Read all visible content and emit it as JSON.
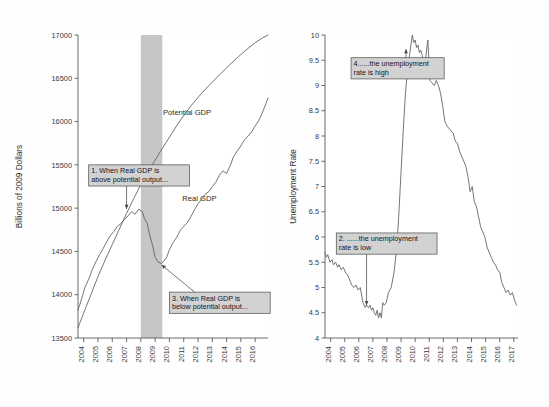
{
  "figure": {
    "background": "#fefefe",
    "line_color": "#5d5d5d",
    "recession_color": "#c6c6c6",
    "callout_fill": "#d2d2d2"
  },
  "chart_data": [
    {
      "type": "line",
      "panel": "left",
      "title": "",
      "xlabel": "",
      "ylabel": "Billions of 2009 Dollars",
      "xlim": [
        2003.6,
        2016.9
      ],
      "ylim": [
        13500,
        17000
      ],
      "yticks": [
        13500,
        14000,
        14500,
        15000,
        15500,
        16000,
        16500,
        17000
      ],
      "xticks": [
        2004,
        2005,
        2006,
        2007,
        2008,
        2009,
        2010,
        2011,
        2012,
        2013,
        2014,
        2015,
        2016
      ],
      "grid": false,
      "legend_position": "inline-labels",
      "shaded_regions": [
        {
          "name": "recession",
          "x0": 2008.0,
          "x1": 2009.5
        }
      ],
      "series": [
        {
          "name": "Potential GDP",
          "label_x": 2009.55,
          "label_y": 16080,
          "x": [
            2003.6,
            2004.0,
            2004.5,
            2005.0,
            2005.5,
            2006.0,
            2006.5,
            2007.0,
            2007.5,
            2008.0,
            2008.5,
            2009.0,
            2009.5,
            2010.0,
            2010.5,
            2011.0,
            2011.5,
            2012.0,
            2012.5,
            2013.0,
            2013.5,
            2014.0,
            2014.5,
            2015.0,
            2015.5,
            2016.0,
            2016.5,
            2016.9
          ],
          "values": [
            13620,
            13790,
            14000,
            14210,
            14400,
            14580,
            14760,
            14940,
            15110,
            15275,
            15420,
            15555,
            15690,
            15820,
            15950,
            16070,
            16180,
            16280,
            16370,
            16455,
            16540,
            16620,
            16700,
            16775,
            16845,
            16910,
            16965,
            17000
          ]
        },
        {
          "name": "Real GDP",
          "label_x": 2010.9,
          "label_y": 15080,
          "x": [
            2003.6,
            2003.85,
            2004.1,
            2004.35,
            2004.6,
            2004.85,
            2005.1,
            2005.35,
            2005.6,
            2005.85,
            2006.1,
            2006.35,
            2006.6,
            2006.85,
            2007.1,
            2007.35,
            2007.6,
            2007.85,
            2008.1,
            2008.25,
            2008.45,
            2008.6,
            2008.85,
            2009.0,
            2009.2,
            2009.4,
            2009.6,
            2009.8,
            2010.0,
            2010.25,
            2010.5,
            2010.75,
            2011.0,
            2011.25,
            2011.5,
            2011.75,
            2012.0,
            2012.25,
            2012.5,
            2012.75,
            2013.0,
            2013.25,
            2013.5,
            2013.75,
            2014.0,
            2014.25,
            2014.5,
            2014.75,
            2015.0,
            2015.25,
            2015.5,
            2015.75,
            2016.0,
            2016.25,
            2016.5,
            2016.9
          ],
          "values": [
            13820,
            13950,
            14090,
            14180,
            14290,
            14380,
            14460,
            14530,
            14610,
            14680,
            14730,
            14790,
            14820,
            14870,
            14910,
            14960,
            14930,
            14990,
            14960,
            14880,
            14820,
            14700,
            14550,
            14430,
            14380,
            14360,
            14385,
            14430,
            14520,
            14600,
            14660,
            14740,
            14790,
            14830,
            14900,
            14980,
            15050,
            15100,
            15160,
            15190,
            15250,
            15300,
            15380,
            15430,
            15400,
            15490,
            15600,
            15660,
            15720,
            15790,
            15830,
            15880,
            15950,
            16010,
            16100,
            16270
          ]
        }
      ],
      "annotations": [
        {
          "id": "callout-1",
          "text_lines": [
            "1. When Real GDP is",
            "above potential output..."
          ],
          "box_x": 2004.35,
          "box_y": 15500,
          "point_x": 2007.0,
          "point_y": 14990
        },
        {
          "id": "callout-3",
          "text_lines": [
            "3. When Real GDP is",
            "below potential output..."
          ],
          "box_x": 2010.0,
          "box_y": 14030,
          "point_x": 2009.45,
          "point_y": 14345
        }
      ]
    },
    {
      "type": "line",
      "panel": "right",
      "title": "",
      "xlabel": "",
      "ylabel": "Unemployment Rate",
      "xlim": [
        2003.6,
        2017.3
      ],
      "ylim": [
        4,
        10
      ],
      "yticks": [
        4,
        4.5,
        5,
        5.5,
        6,
        6.5,
        7,
        7.5,
        8,
        8.5,
        9,
        9.5,
        10
      ],
      "xticks": [
        2004,
        2005,
        2006,
        2007,
        2008,
        2009,
        2010,
        2011,
        2012,
        2013,
        2014,
        2015,
        2016,
        2017
      ],
      "grid": false,
      "legend_position": "none",
      "series": [
        {
          "name": "Unemployment Rate",
          "x": [
            2003.6,
            2003.7,
            2003.8,
            2003.95,
            2004.1,
            2004.2,
            2004.35,
            2004.5,
            2004.6,
            2004.75,
            2004.9,
            2005.05,
            2005.2,
            2005.35,
            2005.5,
            2005.65,
            2005.8,
            2005.95,
            2006.1,
            2006.2,
            2006.3,
            2006.45,
            2006.55,
            2006.7,
            2006.8,
            2006.9,
            2007.0,
            2007.1,
            2007.2,
            2007.3,
            2007.4,
            2007.5,
            2007.6,
            2007.7,
            2007.8,
            2007.95,
            2008.1,
            2008.3,
            2008.5,
            2008.7,
            2008.85,
            2009.0,
            2009.15,
            2009.3,
            2009.45,
            2009.6,
            2009.7,
            2009.8,
            2009.9,
            2010.0,
            2010.1,
            2010.2,
            2010.3,
            2010.4,
            2010.5,
            2010.6,
            2010.75,
            2010.9,
            2011.05,
            2011.2,
            2011.35,
            2011.5,
            2011.65,
            2011.8,
            2011.95,
            2012.1,
            2012.25,
            2012.4,
            2012.55,
            2012.7,
            2012.85,
            2013.0,
            2013.15,
            2013.3,
            2013.45,
            2013.6,
            2013.75,
            2013.9,
            2014.05,
            2014.2,
            2014.35,
            2014.5,
            2014.65,
            2014.8,
            2014.95,
            2015.1,
            2015.25,
            2015.4,
            2015.55,
            2015.7,
            2015.85,
            2016.0,
            2016.15,
            2016.3,
            2016.45,
            2016.6,
            2016.75,
            2016.9,
            2017.05,
            2017.2
          ],
          "values": [
            5.7,
            5.6,
            5.65,
            5.5,
            5.55,
            5.45,
            5.5,
            5.4,
            5.45,
            5.35,
            5.4,
            5.3,
            5.25,
            5.15,
            5.05,
            5.0,
            5.05,
            4.95,
            5.0,
            4.85,
            4.7,
            4.6,
            4.65,
            4.6,
            4.65,
            4.55,
            4.6,
            4.5,
            4.45,
            4.55,
            4.4,
            4.5,
            4.4,
            4.7,
            4.65,
            4.7,
            4.9,
            5.0,
            5.3,
            5.8,
            6.5,
            7.3,
            8.1,
            8.8,
            9.3,
            9.6,
            9.8,
            10.0,
            9.85,
            9.9,
            9.75,
            9.8,
            9.65,
            9.7,
            9.6,
            9.45,
            9.55,
            9.9,
            9.1,
            9.05,
            9.0,
            9.1,
            9.0,
            8.85,
            8.6,
            8.3,
            8.2,
            8.15,
            8.1,
            8.05,
            7.9,
            7.85,
            7.7,
            7.6,
            7.5,
            7.4,
            7.2,
            6.9,
            7.0,
            6.7,
            6.6,
            6.4,
            6.2,
            6.1,
            6.0,
            5.8,
            5.7,
            5.6,
            5.5,
            5.45,
            5.35,
            5.3,
            5.1,
            5.0,
            4.9,
            4.95,
            4.85,
            4.9,
            4.75,
            4.65
          ]
        }
      ],
      "annotations": [
        {
          "id": "callout-4",
          "text_lines": [
            "4......the unemployment",
            "rate is high"
          ],
          "box_x": 2005.45,
          "box_y": 9.55,
          "point_x": 2009.35,
          "point_y": 9.72
        },
        {
          "id": "callout-2",
          "text_lines": [
            "2. ......the unemployment",
            "rate is low"
          ],
          "box_x": 2004.4,
          "box_y": 6.08,
          "point_x": 2006.55,
          "point_y": 4.65
        }
      ]
    }
  ]
}
